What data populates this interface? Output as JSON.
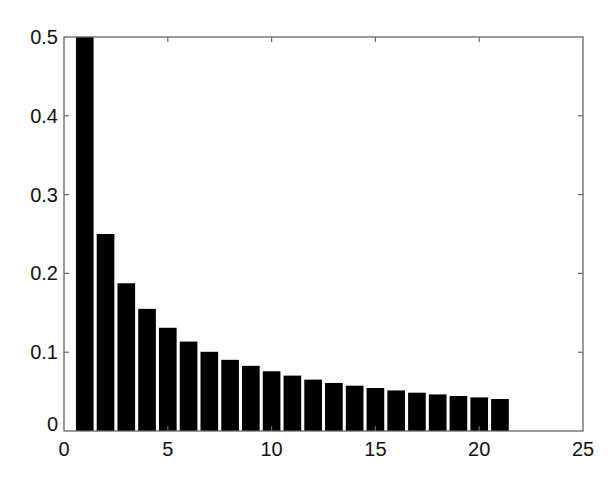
{
  "chart_data": {
    "type": "bar",
    "title": "",
    "xlabel": "",
    "ylabel": "",
    "xlim": [
      0,
      25
    ],
    "ylim": [
      0,
      0.5
    ],
    "grid": false,
    "legend": null,
    "bar_color": "#000000",
    "x": [
      1,
      2,
      3,
      4,
      5,
      6,
      7,
      8,
      9,
      10,
      11,
      12,
      13,
      14,
      15,
      16,
      17,
      18,
      19,
      20,
      21
    ],
    "values": [
      0.5,
      0.25,
      0.1875,
      0.155,
      0.131,
      0.1135,
      0.1005,
      0.0903,
      0.0827,
      0.0758,
      0.0703,
      0.0652,
      0.061,
      0.0575,
      0.0546,
      0.0515,
      0.0486,
      0.0464,
      0.0444,
      0.0426,
      0.0406
    ],
    "xticks": [
      0,
      5,
      10,
      15,
      20,
      25
    ],
    "xtick_labels": [
      "0",
      "5",
      "10",
      "15",
      "20",
      "25"
    ],
    "yticks": [
      0,
      0.1,
      0.2,
      0.3,
      0.4,
      0.5
    ],
    "ytick_labels": [
      "0",
      "0.1",
      "0.2",
      "0.3",
      "0.4",
      "0.5"
    ]
  },
  "caption": {
    "text": "",
    "cropped": true
  }
}
